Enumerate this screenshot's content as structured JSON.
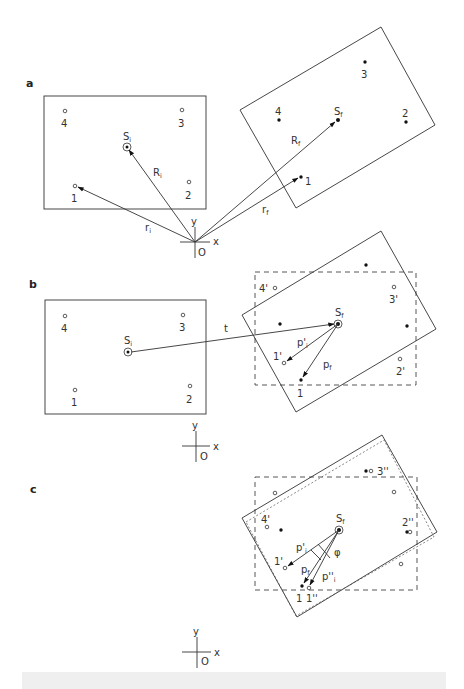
{
  "figure": {
    "panels": [
      {
        "id": "a",
        "label": "a",
        "initial_points": [
          "1",
          "2",
          "3",
          "4"
        ],
        "final_points": [
          "1",
          "2",
          "3",
          "4"
        ],
        "centroid_initial": {
          "base": "S",
          "sub": "i"
        },
        "centroid_final": {
          "base": "S",
          "sub": "f"
        },
        "vectors": [
          {
            "base": "R",
            "sub": "i"
          },
          {
            "base": "R",
            "sub": "f"
          },
          {
            "base": "r",
            "sub": "i"
          },
          {
            "base": "r",
            "sub": "f"
          }
        ],
        "axes": {
          "x": "x",
          "y": "y",
          "origin": "O"
        }
      },
      {
        "id": "b",
        "label": "b",
        "initial_points": [
          "1",
          "2",
          "3",
          "4"
        ],
        "translated_points": [
          "1'",
          "2'",
          "3'",
          "4'"
        ],
        "final_points": [
          "1"
        ],
        "centroid_initial": {
          "base": "S",
          "sub": "i"
        },
        "centroid_final": {
          "base": "S",
          "sub": "f"
        },
        "translation_label": "t",
        "vectors": [
          {
            "base": "p'",
            "sub": "i"
          },
          {
            "base": "p",
            "sub": "f"
          }
        ],
        "axes": {
          "x": "x",
          "y": "y",
          "origin": "O"
        }
      },
      {
        "id": "c",
        "label": "c",
        "translated_points": [
          "1'",
          "4'"
        ],
        "rotated_points": [
          "1''",
          "2''",
          "3''"
        ],
        "final_points": [
          "1"
        ],
        "centroid_final": {
          "base": "S",
          "sub": "f"
        },
        "angle_label": "φ",
        "vectors": [
          {
            "base": "p'",
            "sub": "i"
          },
          {
            "base": "p",
            "sub": "f"
          },
          {
            "base": "p''",
            "sub": "i"
          }
        ],
        "axes": {
          "x": "x",
          "y": "y",
          "origin": "O"
        }
      }
    ],
    "caption": ""
  }
}
